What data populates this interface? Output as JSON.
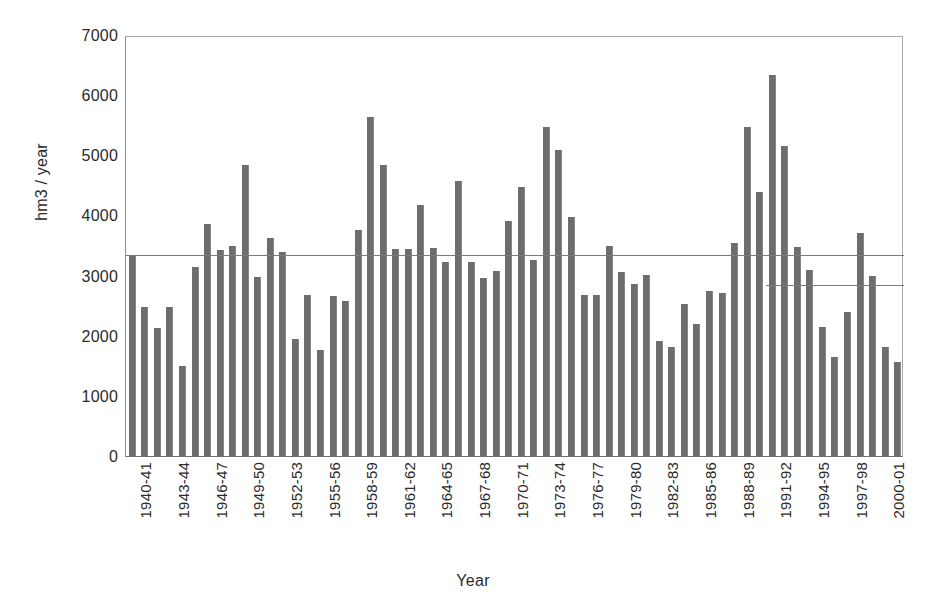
{
  "chart_data": {
    "type": "bar",
    "title": "",
    "xlabel": "Year",
    "ylabel": "hm3 / year",
    "ylim": [
      0,
      7000
    ],
    "yticks": [
      0,
      1000,
      2000,
      3000,
      4000,
      5000,
      6000,
      7000
    ],
    "grid": false,
    "legend": "none",
    "bar_color": "#6d6d6d",
    "xtick_step": 3,
    "categories": [
      "1940-41",
      "1941-42",
      "1942-43",
      "1943-44",
      "1944-45",
      "1945-46",
      "1946-47",
      "1947-48",
      "1948-49",
      "1949-50",
      "1950-51",
      "1951-52",
      "1952-53",
      "1953-54",
      "1954-55",
      "1955-56",
      "1956-57",
      "1957-58",
      "1958-59",
      "1959-60",
      "1960-61",
      "1961-62",
      "1962-63",
      "1963-64",
      "1964-65",
      "1965-66",
      "1966-67",
      "1967-68",
      "1968-69",
      "1969-70",
      "1970-71",
      "1971-72",
      "1972-73",
      "1973-74",
      "1974-75",
      "1975-76",
      "1976-77",
      "1977-78",
      "1978-79",
      "1979-80",
      "1980-81",
      "1981-82",
      "1982-83",
      "1983-84",
      "1984-85",
      "1985-86",
      "1986-87",
      "1987-88",
      "1988-89",
      "1989-90",
      "1990-91",
      "1991-92",
      "1992-93",
      "1993-94",
      "1994-95",
      "1995-96",
      "1996-97",
      "1997-98",
      "1998-99",
      "1999-00",
      "2000-01",
      "2001-02"
    ],
    "values": [
      3350,
      2470,
      2130,
      2470,
      1500,
      3140,
      3860,
      3430,
      3500,
      4840,
      2970,
      3620,
      3400,
      1940,
      2670,
      1770,
      2660,
      2570,
      3760,
      5640,
      4840,
      3450,
      3450,
      4180,
      3460,
      3220,
      4570,
      3230,
      2960,
      3080,
      3900,
      4480,
      3260,
      5470,
      5080,
      3970,
      2680,
      2680,
      3500,
      3060,
      2860,
      3010,
      1910,
      1810,
      2530,
      2200,
      2750,
      2710,
      3540,
      5470,
      4390,
      6340,
      5160,
      3470,
      3090,
      2150,
      1650,
      2400,
      3700,
      3000,
      1810,
      1570
    ],
    "reference_lines": [
      {
        "name": "long-term-mean",
        "value": 3330,
        "x_start_category": 0,
        "x_end_category": 61
      },
      {
        "name": "recent-period-mean",
        "value": 2830,
        "x_start_category": 51,
        "x_end_category": 61
      }
    ],
    "extra_bars_note": [
      {
        "category": "2000-01",
        "value": 3350
      },
      {
        "category": "2001-02",
        "value": 2530
      }
    ]
  }
}
